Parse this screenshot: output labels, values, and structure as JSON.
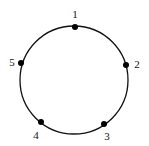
{
  "diagram": {
    "type": "circle-with-points",
    "circle": {
      "cx": 74,
      "cy": 80,
      "r": 54,
      "stroke": "#111111"
    },
    "points": [
      {
        "label": "1",
        "x": 75,
        "y": 27,
        "lx": 75,
        "ly": 18
      },
      {
        "label": "2",
        "x": 126,
        "y": 65,
        "lx": 137,
        "ly": 68
      },
      {
        "label": "3",
        "x": 104,
        "y": 124,
        "lx": 107,
        "ly": 140
      },
      {
        "label": "4",
        "x": 41,
        "y": 122,
        "lx": 36,
        "ly": 139
      },
      {
        "label": "5",
        "x": 21,
        "y": 63,
        "lx": 12,
        "ly": 66
      }
    ]
  }
}
